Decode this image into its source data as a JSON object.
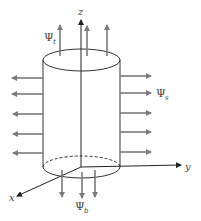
{
  "figure": {
    "axes": {
      "z_label": "z",
      "y_label": "y",
      "x_label": "x"
    },
    "flux_labels": {
      "top": {
        "symbol": "Ψ",
        "subscript": "t"
      },
      "side": {
        "symbol": "Ψ",
        "subscript": "s"
      },
      "bottom": {
        "symbol": "Ψ",
        "subscript": "b"
      }
    },
    "colors": {
      "outline": "#333333",
      "arrow": "#7a7a7a",
      "background": "#ffffff"
    },
    "arrow_counts": {
      "top": 3,
      "left": 5,
      "right": 5,
      "bottom": 3
    }
  }
}
